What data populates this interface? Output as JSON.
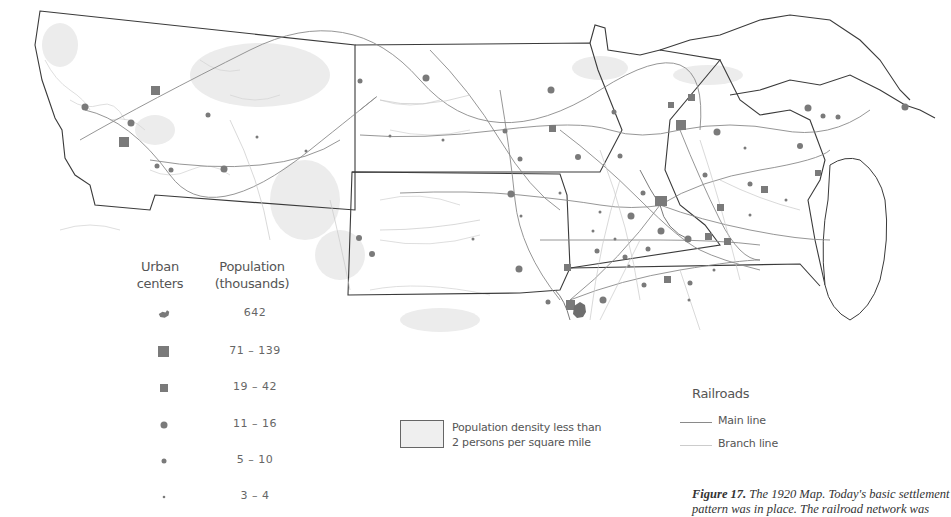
{
  "figure": {
    "number_label": "Figure 17.",
    "caption_line1": "The 1920 Map. Today's basic settlement",
    "caption_line2": "pattern was in place. The railroad network was"
  },
  "legend_urban": {
    "header_symbol": "Urban centers",
    "header_symbol_line1": "Urban",
    "header_symbol_line2": "centers",
    "header_value_line1": "Population",
    "header_value_line2": "(thousands)",
    "rows": [
      {
        "symbol": "city-outline-shape",
        "value": "642"
      },
      {
        "symbol": "large-square",
        "value": "71 – 139"
      },
      {
        "symbol": "small-square",
        "value": "19 – 42"
      },
      {
        "symbol": "large-circle",
        "value": "11 – 16"
      },
      {
        "symbol": "medium-circle",
        "value": "5 – 10"
      },
      {
        "symbol": "small-dot",
        "value": "3 – 4"
      }
    ]
  },
  "legend_density": {
    "line1": "Population density less than",
    "line2": "2 persons per square mile"
  },
  "legend_railroads": {
    "title": "Railroads",
    "items": [
      {
        "label": "Main line",
        "style": "main"
      },
      {
        "label": "Branch line",
        "style": "branch"
      }
    ]
  },
  "colors": {
    "symbol_fill": "#7a7a7a",
    "border": "#3a3a3a",
    "rail_main": "#8a8a8a",
    "rail_branch": "#c8c8c8",
    "sparse_area": "#e6e6e6",
    "terrain": "#cfcfcf"
  }
}
